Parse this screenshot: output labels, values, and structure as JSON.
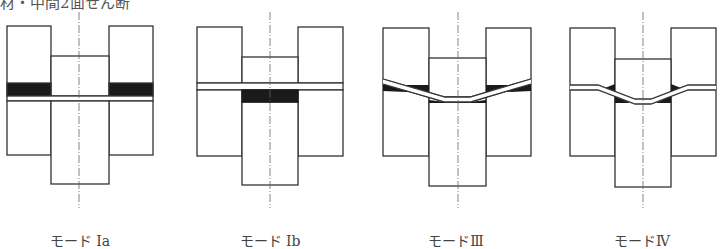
{
  "caption_fragment": "材・中間2面せん断",
  "panels": [
    {
      "id": "mode-1a",
      "label": "モード Ia",
      "failure": "yielding of outer members (embedment in side members)"
    },
    {
      "id": "mode-1b",
      "label": "モード Ib",
      "failure": "yielding of center member (embedment in main member)"
    },
    {
      "id": "mode-3",
      "label": "モードⅢ",
      "failure": "one plastic hinge per shear plane in fastener"
    },
    {
      "id": "mode-4",
      "label": "モードⅣ",
      "failure": "two plastic hinges per shear plane in fastener"
    }
  ],
  "colors": {
    "line": "#333333",
    "fill": "#1a1a1a",
    "centerline": "#666666"
  }
}
